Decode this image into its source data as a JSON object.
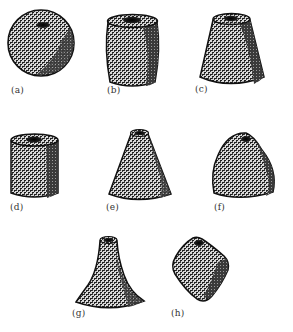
{
  "figure": {
    "shapes": [
      {
        "id": "a",
        "label": "(a)",
        "kind": "sphere"
      },
      {
        "id": "b",
        "label": "(b)",
        "kind": "barrel"
      },
      {
        "id": "c",
        "label": "(c)",
        "kind": "truncated-cone"
      },
      {
        "id": "d",
        "label": "(d)",
        "kind": "cylinder"
      },
      {
        "id": "e",
        "label": "(e)",
        "kind": "cone"
      },
      {
        "id": "f",
        "label": "(f)",
        "kind": "rounded-tetrahedron"
      },
      {
        "id": "g",
        "label": "(g)",
        "kind": "flared-cone"
      },
      {
        "id": "h",
        "label": "(h)",
        "kind": "rounded-cube"
      }
    ]
  },
  "colors": {
    "ink": "#1a1a1a",
    "paper": "#ffffff",
    "shade": "#2b2b2b"
  }
}
